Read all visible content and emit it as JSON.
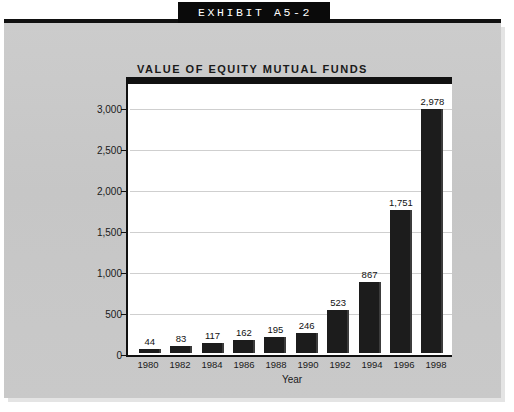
{
  "banner": {
    "text": "EXHIBIT A5-2"
  },
  "chart_data": {
    "type": "bar",
    "title": "VALUE OF EQUITY MUTUAL FUNDS",
    "xlabel": "Year",
    "ylabel_line1": "Value of stocks owned through equity mutual funds",
    "ylabel_line2": "(billions of dollars)",
    "categories": [
      "1980",
      "1982",
      "1984",
      "1986",
      "1988",
      "1990",
      "1992",
      "1994",
      "1996",
      "1998"
    ],
    "values": [
      44,
      83,
      117,
      162,
      195,
      246,
      523,
      867,
      1751,
      2978
    ],
    "value_labels": [
      "44",
      "83",
      "117",
      "162",
      "195",
      "246",
      "523",
      "867",
      "1,751",
      "2,978"
    ],
    "ylim": [
      0,
      3200
    ],
    "yticks": [
      0,
      500,
      1000,
      1500,
      2000,
      2500,
      3000
    ],
    "ytick_labels": [
      "0",
      "500",
      "1,000",
      "1,500",
      "2,000",
      "2,500",
      "3,000"
    ],
    "grid": true,
    "legend": "none",
    "bar_color": "#1c1c1c",
    "plot_background": "#ffffff",
    "panel_background": "#c9c9c9"
  }
}
